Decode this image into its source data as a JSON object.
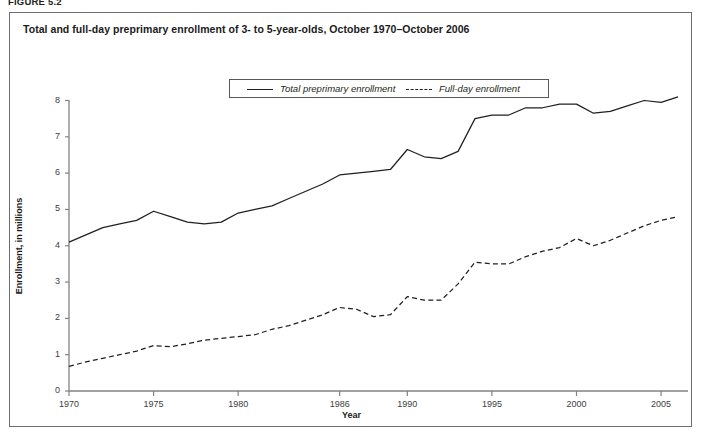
{
  "figure": {
    "label": "FIGURE 5.2",
    "title": "Total and full-day preprimary enrollment of 3- to 5-year-olds, October 1970–October 2006"
  },
  "legend": {
    "entries": [
      {
        "label": "Total preprimary enrollment",
        "style": "solid"
      },
      {
        "label": "Full-day enrollment",
        "style": "dashed"
      }
    ]
  },
  "axes": {
    "x_title": "Year",
    "y_title": "Enrollment, in millions",
    "x_tick_labels": [
      "1970",
      "1975",
      "1980",
      "1986",
      "1990",
      "1995",
      "2000",
      "2005"
    ],
    "y_tick_labels": [
      "0",
      "1",
      "2",
      "3",
      "4",
      "5",
      "6",
      "7",
      "8"
    ]
  },
  "chart_data": {
    "type": "line",
    "title": "Total and full-day preprimary enrollment of 3- to 5-year-olds, October 1970–October 2006",
    "xlabel": "Year",
    "ylabel": "Enrollment, in millions",
    "xlim": [
      1970,
      2006
    ],
    "ylim": [
      0,
      8
    ],
    "grid": false,
    "legend_position": "top-center",
    "x_ticks": [
      1970,
      1975,
      1980,
      1986,
      1990,
      1995,
      2000,
      2005
    ],
    "x_tick_labels": [
      "1970",
      "1975",
      "1980",
      "1986",
      "1990",
      "1995",
      "2000",
      "2005"
    ],
    "y_ticks": [
      0,
      1,
      2,
      3,
      4,
      5,
      6,
      7,
      8
    ],
    "x": [
      1970,
      1971,
      1972,
      1973,
      1974,
      1975,
      1976,
      1977,
      1978,
      1979,
      1980,
      1981,
      1982,
      1983,
      1984,
      1985,
      1986,
      1987,
      1988,
      1989,
      1990,
      1991,
      1992,
      1993,
      1994,
      1995,
      1996,
      1997,
      1998,
      1999,
      2000,
      2001,
      2002,
      2003,
      2004,
      2005,
      2006
    ],
    "series": [
      {
        "name": "Total preprimary enrollment",
        "style": "solid",
        "color": "#231f20",
        "values": [
          4.1,
          4.3,
          4.5,
          4.6,
          4.7,
          4.95,
          4.8,
          4.65,
          4.6,
          4.65,
          4.9,
          5.0,
          5.1,
          5.3,
          5.5,
          5.7,
          5.95,
          6.0,
          6.05,
          6.1,
          6.65,
          6.45,
          6.4,
          6.6,
          7.5,
          7.6,
          7.6,
          7.8,
          7.8,
          7.9,
          7.9,
          7.65,
          7.7,
          7.85,
          8.0,
          7.95,
          8.1
        ]
      },
      {
        "name": "Full-day enrollment",
        "style": "dashed",
        "color": "#231f20",
        "values": [
          0.68,
          0.8,
          0.9,
          1.0,
          1.1,
          1.25,
          1.22,
          1.3,
          1.4,
          1.45,
          1.5,
          1.55,
          1.7,
          1.8,
          1.95,
          2.1,
          2.3,
          2.25,
          2.05,
          2.1,
          2.6,
          2.5,
          2.5,
          2.95,
          3.55,
          3.5,
          3.5,
          3.7,
          3.85,
          3.95,
          4.2,
          4.0,
          4.15,
          4.35,
          4.55,
          4.7,
          4.8
        ]
      }
    ]
  }
}
